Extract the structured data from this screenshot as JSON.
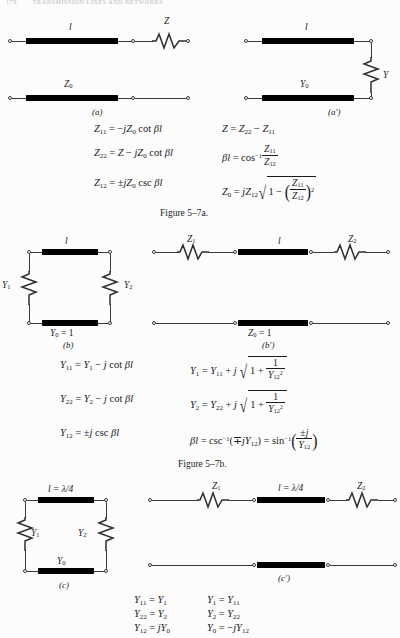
{
  "header": {
    "page_number": "170",
    "running_title": "TRANSMISSION LINES AND NETWORKS"
  },
  "figures": [
    {
      "id": "fig-5-7a",
      "caption": "Figure 5–7a.",
      "panels": [
        {
          "key": "a",
          "subcaption": "(a)",
          "labels": {
            "line_top": "l",
            "line_bottom": "Z₀",
            "series_element": "Z"
          }
        },
        {
          "key": "a-prime",
          "subcaption": "(a′)",
          "labels": {
            "line_top": "l",
            "line_bottom": "Y₀",
            "shunt_element": "Y"
          }
        }
      ],
      "equations": {
        "left_column": [
          "Z₁₁ = −jZ₀ cot βl",
          "Z₂₂ = Z − jZ₀ cot βl",
          "Z₁₂ = ±jZ₀ csc βl"
        ],
        "right_column": [
          "Z = Z₂₂ − Z₁₁",
          "βl = cos⁻¹ Z₁₁/Z₁₂",
          "Z₀ = jZ₁₂ √(1 − (Z₁₁/Z₁₂)²)"
        ]
      }
    },
    {
      "id": "fig-5-7b",
      "caption": "Figure 5–7b.",
      "panels": [
        {
          "key": "b",
          "subcaption": "(b)",
          "labels": {
            "line_top": "l",
            "line_bottom": "Y₀ = 1",
            "shunt_left": "Y₁",
            "shunt_right": "Y₂"
          }
        },
        {
          "key": "b-prime",
          "subcaption": "(b′)",
          "labels": {
            "line_mid": "l",
            "line_bottom": "Z₀ = 1",
            "series_left": "Z₁",
            "series_right": "Z₂"
          }
        }
      ],
      "equations": {
        "left_column": [
          "Y₁₁ = Y₁ − j cot βl",
          "Y₂₂ = Y₂ − j cot βl",
          "Y₁₂ = ±j csc βl"
        ],
        "right_column": [
          "Y₁ = Y₁₁ + j √(1 + 1/Y₁₂²)",
          "Y₂ = Y₂₂ + j √(1 + 1/Y₁₂²)",
          "βl = csc⁻¹(∓jY₁₂) = sin⁻¹(±j/Y₁₂)"
        ]
      }
    },
    {
      "id": "fig-5-7c",
      "caption": "",
      "panels": [
        {
          "key": "c",
          "subcaption": "(c)",
          "labels": {
            "line_top": "l = λ/4",
            "line_bottom": "Y₀",
            "shunt_left": "Y₁",
            "shunt_right": "Y₂"
          }
        },
        {
          "key": "c-prime",
          "subcaption": "(c′)",
          "labels": {
            "line_mid": "l = λ/4",
            "series_left": "Z₁",
            "series_right": "Z₂"
          }
        }
      ],
      "equations": {
        "left_column": [
          "Y₁₁ = Y₁",
          "Y₂₂ = Y₂",
          "Y₁₂ = jY₀"
        ],
        "right_column": [
          "Y₁ = Y₁₁",
          "Y₂ = Y₂₂",
          "Y₀ = −jY₁₂"
        ]
      }
    }
  ],
  "symbols": {
    "l": "l",
    "Z": "Z",
    "Y": "Y",
    "Z0": "Z0",
    "Y0": "Y0",
    "Z1": "Z1",
    "Z2": "Z2",
    "Y1": "Y1",
    "Y2": "Y2",
    "lambda_quarter": "l = λ/4",
    "Y0_eq_1": "Y0 = 1",
    "Z0_eq_1": "Z0 = 1"
  },
  "colors": {
    "ink": "#1b1b1b",
    "wire": "#3a3a3a",
    "line_block": "#000000",
    "paper": "#fcfcfc",
    "faint_header": "#b9b9b9"
  }
}
